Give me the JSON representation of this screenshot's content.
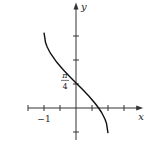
{
  "chart_data": {
    "type": "line",
    "title": "",
    "xlabel": "x",
    "ylabel": "y",
    "function": "y = arccos(x) - pi/4",
    "xlim": [
      -1.5,
      2.1
    ],
    "ylim": [
      -1.0,
      3.3
    ],
    "x_ticks": [
      -1.5,
      -1,
      -0.5,
      0.5,
      1,
      1.5
    ],
    "x_tick_labels": [
      {
        "value": -1,
        "text": "−1"
      }
    ],
    "y_ticks": [
      -0.75,
      0.75,
      1.5,
      2.25
    ],
    "y_tick_labels": [
      {
        "value": 0.785,
        "num": "π",
        "den": "4"
      }
    ],
    "series": [
      {
        "name": "curve",
        "x": [
          -1,
          -0.95,
          -0.9,
          -0.8,
          -0.6,
          -0.4,
          -0.2,
          0,
          0.2,
          0.4,
          0.6,
          0.7071,
          0.8,
          0.9,
          0.95,
          1
        ],
        "y": [
          2.356,
          2.038,
          1.906,
          1.712,
          1.429,
          1.197,
          0.987,
          0.785,
          0.587,
          0.374,
          0.142,
          0.0,
          -0.142,
          -0.334,
          -0.467,
          -0.785
        ]
      }
    ],
    "grid": false
  }
}
